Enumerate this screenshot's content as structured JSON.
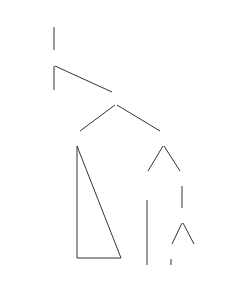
{
  "example_label": "2a",
  "nodes": {
    "cp": "CP",
    "c_bar": "C′",
    "c": "C",
    "ip": "IP",
    "np_subject": "NP",
    "i_bar": "I′",
    "i": "I",
    "i_feature": "[+Tense]",
    "vp": "VP",
    "v_bar": "V′",
    "v": "V",
    "np_object": "NP"
  },
  "leaves": {
    "subject_line1": "Lord",
    "subject_line2": "Emsworth",
    "aux": "will",
    "verb": "invite",
    "object": "whom"
  },
  "colors": {
    "ink": "#2a2a2a",
    "background": "#ffffff"
  }
}
